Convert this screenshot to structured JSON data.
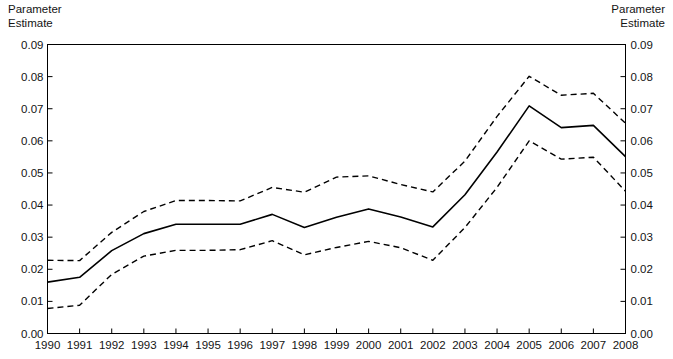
{
  "labels": {
    "left_axis_caption": "Parameter\nEstimate",
    "right_axis_caption": "Parameter\nEstimate"
  },
  "chart_data": {
    "type": "line",
    "title": "",
    "xlabel": "",
    "ylabel": "Parameter Estimate",
    "y2label": "Parameter Estimate",
    "grid": false,
    "legend": "none",
    "xlim": [
      1990,
      2008
    ],
    "ylim": [
      0.0,
      0.09
    ],
    "ytick_labels": [
      "0.00",
      "0.01",
      "0.02",
      "0.03",
      "0.04",
      "0.05",
      "0.06",
      "0.07",
      "0.08",
      "0.09"
    ],
    "ytick_values": [
      0.0,
      0.01,
      0.02,
      0.03,
      0.04,
      0.05,
      0.06,
      0.07,
      0.08,
      0.09
    ],
    "categories": [
      1990,
      1991,
      1992,
      1993,
      1994,
      1995,
      1996,
      1997,
      1998,
      1999,
      2000,
      2001,
      2002,
      2003,
      2004,
      2005,
      2006,
      2007,
      2008
    ],
    "xtick_labels": [
      "1990",
      "1991",
      "1992",
      "1993",
      "1994",
      "1995",
      "1996",
      "1997",
      "1998",
      "1999",
      "2000",
      "2001",
      "2002",
      "2003",
      "2004",
      "2005",
      "2006",
      "2007",
      "2008"
    ],
    "series": [
      {
        "name": "Upper Confidence Limit",
        "style": "dashed",
        "color": "#000000",
        "values": [
          0.0228,
          0.0227,
          0.0315,
          0.038,
          0.0414,
          0.0414,
          0.0413,
          0.0455,
          0.044,
          0.0487,
          0.0491,
          0.0464,
          0.0441,
          0.0537,
          0.0676,
          0.0801,
          0.0742,
          0.0748,
          0.0655
        ]
      },
      {
        "name": "Parameter Estimate",
        "style": "solid",
        "color": "#000000",
        "values": [
          0.016,
          0.0175,
          0.0258,
          0.0311,
          0.034,
          0.034,
          0.034,
          0.0371,
          0.033,
          0.0362,
          0.0388,
          0.0363,
          0.0332,
          0.0432,
          0.0565,
          0.0709,
          0.0641,
          0.0648,
          0.0551
        ]
      },
      {
        "name": "Lower Confidence Limit",
        "style": "dashed",
        "color": "#000000",
        "values": [
          0.0078,
          0.0088,
          0.0184,
          0.0241,
          0.0259,
          0.0259,
          0.0261,
          0.0289,
          0.0245,
          0.0268,
          0.0287,
          0.0267,
          0.0228,
          0.033,
          0.0455,
          0.06,
          0.0543,
          0.0549,
          0.0443
        ]
      }
    ]
  }
}
